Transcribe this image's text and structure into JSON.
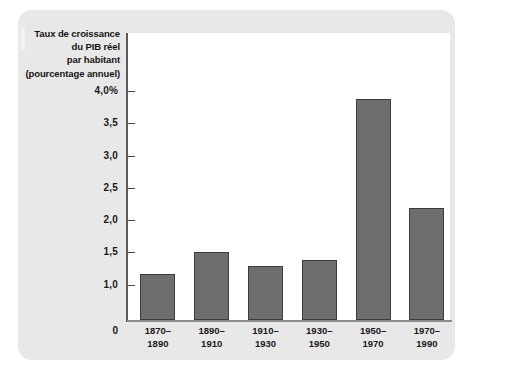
{
  "chart_data": {
    "type": "bar",
    "title": "",
    "ylabel_lines": [
      "Taux de croissance",
      "du PIB réel",
      "par habitant",
      "(pourcentage annuel)"
    ],
    "xlabel": "",
    "categories": [
      "1870–1890",
      "1890–1910",
      "1910–1930",
      "1930–1950",
      "1950–1970",
      "1970–1990"
    ],
    "category_lines": [
      [
        "1870–",
        "1890"
      ],
      [
        "1890–",
        "1910"
      ],
      [
        "1910–",
        "1930"
      ],
      [
        "1930–",
        "1950"
      ],
      [
        "1950–",
        "1970"
      ],
      [
        "1970–",
        "1990"
      ]
    ],
    "values": [
      1.17,
      1.51,
      1.29,
      1.38,
      3.87,
      2.19
    ],
    "ytick_labels": [
      "4,0%",
      "3,5",
      "3,0",
      "2,5",
      "2,0",
      "1,5",
      "1,0",
      "0"
    ],
    "ytick_values": [
      4.0,
      3.5,
      3.0,
      2.5,
      2.0,
      1.5,
      1.0,
      0
    ],
    "ylim": [
      0,
      4.0
    ],
    "grid": false,
    "legend": "none",
    "axis_truncated_at": 0.45,
    "units": "pourcentage annuel",
    "colors": {
      "bar_fill": "#6e6e6e",
      "bar_stroke": "#3c3c3c",
      "plot_background": "#ffffff",
      "card_background": "#e8e8e8",
      "page_background": "#ffffff",
      "axis": "#5a5a5a",
      "text": "#1a1a1a"
    }
  }
}
